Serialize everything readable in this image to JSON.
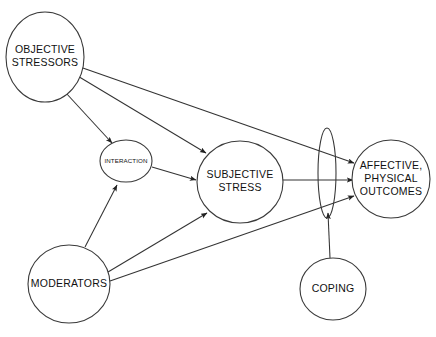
{
  "diagram": {
    "colors": {
      "background": "#ffffff",
      "stroke": "#3a3a3a",
      "edge": "#333333",
      "text": "#111111"
    },
    "nodes": [
      {
        "id": "objective-stressors",
        "label_lines": [
          "OBJECTIVE",
          "STRESSORS"
        ],
        "shape": "ellipse",
        "cx": 45,
        "cy": 57,
        "rx": 39,
        "ry": 45,
        "text_size": "large"
      },
      {
        "id": "interaction",
        "label_lines": [
          "INTERACTION"
        ],
        "shape": "circle",
        "cx": 126,
        "cy": 161,
        "rx": 26,
        "ry": 21,
        "text_size": "small"
      },
      {
        "id": "subjective-stress",
        "label_lines": [
          "SUBJECTIVE",
          "STRESS"
        ],
        "shape": "circle",
        "cx": 240,
        "cy": 182,
        "rx": 43,
        "ry": 41,
        "text_size": "large"
      },
      {
        "id": "moderators",
        "label_lines": [
          "MODERATORS"
        ],
        "shape": "circle",
        "cx": 69,
        "cy": 284,
        "rx": 41,
        "ry": 39,
        "text_size": "large"
      },
      {
        "id": "coping",
        "label_lines": [
          "COPING"
        ],
        "shape": "circle",
        "cx": 333,
        "cy": 289,
        "rx": 33,
        "ry": 31,
        "text_size": "large"
      },
      {
        "id": "affective-physical-outcomes",
        "label_lines": [
          "AFFECTIVE,",
          "PHYSICAL",
          "OUTCOMES"
        ],
        "shape": "circle",
        "cx": 391,
        "cy": 179,
        "rx": 39,
        "ry": 39,
        "text_size": "large"
      },
      {
        "id": "mediator-lens",
        "label_lines": [],
        "shape": "lens-ellipse",
        "cx": 327,
        "cy": 173,
        "rx": 9,
        "ry": 45,
        "text_size": "none"
      }
    ],
    "edges": [
      {
        "id": "objective-to-interaction",
        "from": "objective-stressors",
        "to": "interaction",
        "x1": 66,
        "y1": 93,
        "x2": 112,
        "y2": 143,
        "arrow": true
      },
      {
        "id": "objective-to-subjective",
        "from": "objective-stressors",
        "to": "subjective-stress",
        "x1": 76,
        "y1": 75,
        "x2": 206,
        "y2": 153,
        "arrow": true
      },
      {
        "id": "objective-to-outcomes",
        "from": "objective-stressors",
        "to": "affective-physical-outcomes",
        "x1": 80,
        "y1": 67,
        "x2": 354,
        "y2": 163,
        "arrow": true
      },
      {
        "id": "interaction-to-subjective",
        "from": "interaction",
        "to": "subjective-stress",
        "x1": 152,
        "y1": 167,
        "x2": 196,
        "y2": 180,
        "arrow": true
      },
      {
        "id": "moderators-to-interaction",
        "from": "moderators",
        "to": "interaction",
        "x1": 85,
        "y1": 247,
        "x2": 117,
        "y2": 185,
        "arrow": true
      },
      {
        "id": "moderators-to-subjective",
        "from": "moderators",
        "to": "subjective-stress",
        "x1": 108,
        "y1": 272,
        "x2": 207,
        "y2": 213,
        "arrow": true
      },
      {
        "id": "moderators-to-outcomes",
        "from": "moderators",
        "to": "affective-physical-outcomes",
        "x1": 110,
        "y1": 281,
        "x2": 354,
        "y2": 196,
        "arrow": true
      },
      {
        "id": "subjective-to-outcomes",
        "from": "subjective-stress",
        "to": "affective-physical-outcomes",
        "x1": 283,
        "y1": 180,
        "x2": 353,
        "y2": 180,
        "arrow": true
      },
      {
        "id": "coping-to-lens",
        "from": "coping",
        "to": "mediator-lens",
        "x1": 330,
        "y1": 258,
        "x2": 328,
        "y2": 213,
        "arrow": true
      }
    ]
  }
}
